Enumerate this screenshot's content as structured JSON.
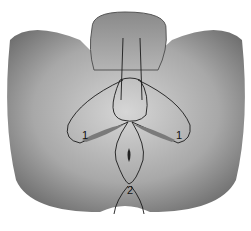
{
  "figure": {
    "type": "anatomical-illustration",
    "colors": {
      "background": "#ffffff",
      "tissue_dark": "#6e6e6e",
      "tissue_light": "#c8c8c8",
      "outline": "#1a1a1a"
    },
    "labels": [
      {
        "id": "label-1-left",
        "text": "1"
      },
      {
        "id": "label-1-right",
        "text": "1"
      },
      {
        "id": "label-2",
        "text": "2"
      }
    ]
  },
  "caption": {
    "text": ""
  }
}
